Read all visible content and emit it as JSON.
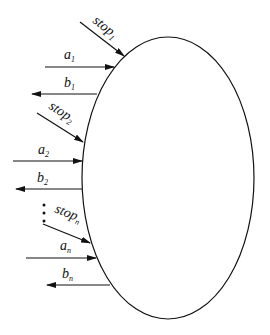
{
  "diagram": {
    "node": {
      "shape": "ellipse",
      "label": ""
    },
    "signals": [
      {
        "id": "stop1",
        "name": "stop",
        "sub": "1",
        "direction": "in"
      },
      {
        "id": "a1",
        "name": "a",
        "sub": "1",
        "direction": "in"
      },
      {
        "id": "b1",
        "name": "b",
        "sub": "1",
        "direction": "out"
      },
      {
        "id": "stop2",
        "name": "stop",
        "sub": "2",
        "direction": "in"
      },
      {
        "id": "a2",
        "name": "a",
        "sub": "2",
        "direction": "in"
      },
      {
        "id": "b2",
        "name": "b",
        "sub": "2",
        "direction": "out"
      },
      {
        "id": "stopn",
        "name": "stop",
        "sub": "n",
        "direction": "in"
      },
      {
        "id": "an",
        "name": "a",
        "sub": "n",
        "direction": "in"
      },
      {
        "id": "bn",
        "name": "b",
        "sub": "n",
        "direction": "out"
      }
    ],
    "ellipsis": "⋮",
    "colors": {
      "stroke": "#111111",
      "background": "#ffffff"
    }
  }
}
